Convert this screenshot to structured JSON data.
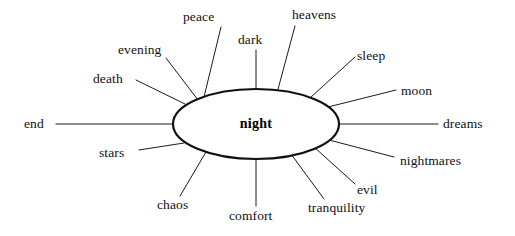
{
  "diagram": {
    "type": "semantic-web",
    "title": "night",
    "center": {
      "label": "night",
      "cx": 256,
      "cy": 124,
      "rx": 83,
      "ry": 35
    },
    "canvas": {
      "width": 515,
      "height": 236
    },
    "colors": {
      "background": "#ffffff",
      "line": "#1a1a1a",
      "ellipse_stroke": "#111111",
      "text": "#111111"
    },
    "nodes": [
      {
        "id": "peace",
        "label": "peace",
        "label_x": 183,
        "label_y": 10,
        "line": {
          "x1": 221,
          "y1": 27,
          "x2": 204,
          "y2": 97
        }
      },
      {
        "id": "dark",
        "label": "dark",
        "label_x": 238,
        "label_y": 33,
        "line": {
          "x1": 256,
          "y1": 50,
          "x2": 256,
          "y2": 89
        }
      },
      {
        "id": "heavens",
        "label": "heavens",
        "label_x": 292,
        "label_y": 8,
        "line": {
          "x1": 295,
          "y1": 26,
          "x2": 277,
          "y2": 93
        }
      },
      {
        "id": "evening",
        "label": "evening",
        "label_x": 118,
        "label_y": 43,
        "line": {
          "x1": 166,
          "y1": 58,
          "x2": 198,
          "y2": 100
        }
      },
      {
        "id": "sleep",
        "label": "sleep",
        "label_x": 357,
        "label_y": 49,
        "line": {
          "x1": 355,
          "y1": 57,
          "x2": 310,
          "y2": 98
        }
      },
      {
        "id": "death",
        "label": "death",
        "label_x": 93,
        "label_y": 72,
        "line": {
          "x1": 136,
          "y1": 80,
          "x2": 185,
          "y2": 104
        }
      },
      {
        "id": "moon",
        "label": "moon",
        "label_x": 401,
        "label_y": 84,
        "line": {
          "x1": 396,
          "y1": 90,
          "x2": 328,
          "y2": 107
        }
      },
      {
        "id": "end",
        "label": "end",
        "label_x": 24,
        "label_y": 117,
        "line": {
          "x1": 56,
          "y1": 124,
          "x2": 173,
          "y2": 124
        }
      },
      {
        "id": "dreams",
        "label": "dreams",
        "label_x": 443,
        "label_y": 117,
        "line": {
          "x1": 438,
          "y1": 124,
          "x2": 339,
          "y2": 124
        }
      },
      {
        "id": "stars",
        "label": "stars",
        "label_x": 99,
        "label_y": 146,
        "line": {
          "x1": 139,
          "y1": 150,
          "x2": 184,
          "y2": 143
        }
      },
      {
        "id": "nightmares",
        "label": "nightmares",
        "label_x": 400,
        "label_y": 154,
        "line": {
          "x1": 394,
          "y1": 157,
          "x2": 329,
          "y2": 140
        }
      },
      {
        "id": "chaos",
        "label": "chaos",
        "label_x": 157,
        "label_y": 198,
        "line": {
          "x1": 180,
          "y1": 196,
          "x2": 206,
          "y2": 152
        }
      },
      {
        "id": "evil",
        "label": "evil",
        "label_x": 357,
        "label_y": 183,
        "line": {
          "x1": 355,
          "y1": 184,
          "x2": 314,
          "y2": 147
        }
      },
      {
        "id": "comfort",
        "label": "comfort",
        "label_x": 229,
        "label_y": 209,
        "line": {
          "x1": 256,
          "y1": 206,
          "x2": 256,
          "y2": 159
        }
      },
      {
        "id": "tranquility",
        "label": "tranquility",
        "label_x": 308,
        "label_y": 201,
        "line": {
          "x1": 324,
          "y1": 199,
          "x2": 291,
          "y2": 154
        }
      }
    ]
  }
}
